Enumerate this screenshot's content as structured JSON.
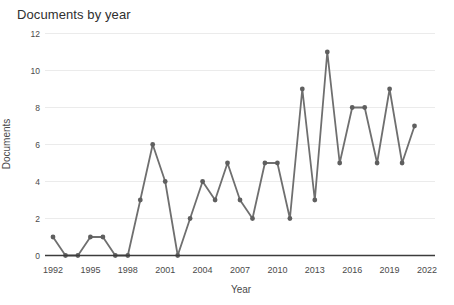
{
  "chart_data": {
    "type": "line",
    "title": "Documents by year",
    "xlabel": "Year",
    "ylabel": "Documents",
    "series_name": "Documents",
    "x": [
      1992,
      1993,
      1994,
      1995,
      1996,
      1997,
      1998,
      1999,
      2000,
      2001,
      2002,
      2003,
      2004,
      2005,
      2006,
      2007,
      2008,
      2009,
      2010,
      2011,
      2012,
      2013,
      2014,
      2015,
      2016,
      2017,
      2018,
      2019,
      2020,
      2021
    ],
    "values": [
      1,
      0,
      0,
      1,
      1,
      0,
      0,
      3,
      6,
      4,
      0,
      2,
      4,
      3,
      5,
      3,
      2,
      5,
      5,
      2,
      9,
      3,
      11,
      5,
      8,
      8,
      5,
      9,
      5,
      7
    ],
    "xticks": [
      1992,
      1995,
      1998,
      2001,
      2004,
      2007,
      2010,
      2013,
      2016,
      2019,
      2022
    ],
    "yticks": [
      0,
      2,
      4,
      6,
      8,
      10,
      12
    ],
    "xlim": [
      1992,
      2022
    ],
    "ylim": [
      0,
      12
    ],
    "grid": "horizontal",
    "legend": "none",
    "colors": {
      "line": "#6f6f6f",
      "marker": "#5f5f5f",
      "grid": "#ebebeb",
      "axis": "#3c3c3c",
      "tick_text": "#4a4a4a",
      "title_text": "#2f2f2f",
      "background": "#ffffff"
    }
  }
}
